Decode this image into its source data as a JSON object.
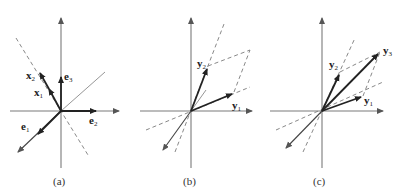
{
  "figure": {
    "panels": [
      {
        "id": "a",
        "caption": "(a)",
        "labels": {
          "x1": "x",
          "x1_sub": "1",
          "x2": "x",
          "x2_sub": "2",
          "e1": "e",
          "e1_sub": "1",
          "e2": "e",
          "e2_sub": "2",
          "e3": "e",
          "e3_sub": "3"
        }
      },
      {
        "id": "b",
        "caption": "(b)",
        "labels": {
          "y1": "y",
          "y1_sub": "1",
          "y2": "y",
          "y2_sub": "2"
        }
      },
      {
        "id": "c",
        "caption": "(c)",
        "labels": {
          "y1": "y",
          "y1_sub": "1",
          "y2": "y",
          "y2_sub": "2",
          "y3": "y",
          "y3_sub": "3"
        }
      }
    ],
    "colors": {
      "axis": "#7a7a7a",
      "vector": "#222222"
    }
  }
}
